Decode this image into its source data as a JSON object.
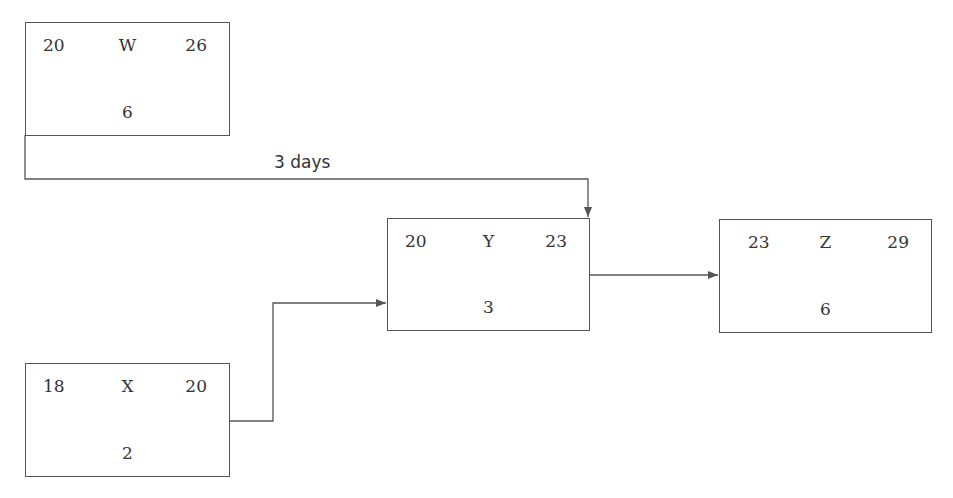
{
  "diagram": {
    "type": "precedence network (activity-on-node)",
    "nodes": [
      {
        "id": "W",
        "label": "W",
        "early_start": "20",
        "early_finish": "26",
        "duration": "6"
      },
      {
        "id": "X",
        "label": "X",
        "early_start": "18",
        "early_finish": "20",
        "duration": "2"
      },
      {
        "id": "Y",
        "label": "Y",
        "early_start": "20",
        "early_finish": "23",
        "duration": "3"
      },
      {
        "id": "Z",
        "label": "Z",
        "early_start": "23",
        "early_finish": "29",
        "duration": "6"
      }
    ],
    "edges": [
      {
        "from": "W",
        "to": "Y",
        "label": "3 days"
      },
      {
        "from": "X",
        "to": "Y",
        "label": ""
      },
      {
        "from": "Y",
        "to": "Z",
        "label": ""
      }
    ]
  },
  "colors": {
    "line": "#555555",
    "text": "#333333",
    "background": "#ffffff"
  }
}
